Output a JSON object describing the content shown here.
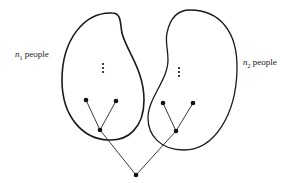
{
  "diagram": {
    "groups": [
      {
        "id": "group-1",
        "variable": "n",
        "subscript": "1",
        "suffix": " people"
      },
      {
        "id": "group-2",
        "variable": "n",
        "subscript": "2",
        "suffix": " people"
      }
    ],
    "ellipsis_symbol": "⋮",
    "colors": {
      "stroke": "#1a1a1a",
      "background": "#ffffff"
    }
  }
}
